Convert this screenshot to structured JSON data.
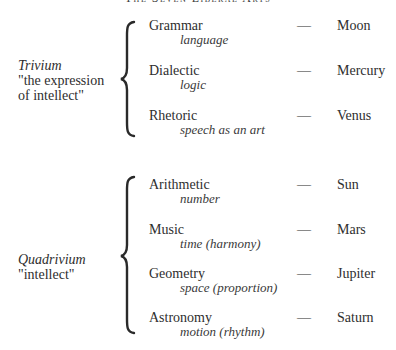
{
  "title": "The Seven Liberal Arts",
  "groups": [
    {
      "name": "Trivium",
      "description_lines": [
        "\"the expression",
        "of intellect\""
      ],
      "items": [
        {
          "art": "Grammar",
          "quality": "language",
          "dash": "—",
          "planet": "Moon"
        },
        {
          "art": "Dialectic",
          "quality": "logic",
          "dash": "—",
          "planet": "Mercury"
        },
        {
          "art": "Rhetoric",
          "quality": "speech as an art",
          "dash": "—",
          "planet": "Venus"
        }
      ]
    },
    {
      "name": "Quadrivium",
      "description_lines": [
        "\"intellect\""
      ],
      "items": [
        {
          "art": "Arithmetic",
          "quality": "number",
          "dash": "—",
          "planet": "Sun"
        },
        {
          "art": "Music",
          "quality": "time (harmony)",
          "dash": "—",
          "planet": "Mars"
        },
        {
          "art": "Geometry",
          "quality": "space (proportion)",
          "dash": "—",
          "planet": "Jupiter"
        },
        {
          "art": "Astronomy",
          "quality": "motion (rhythm)",
          "dash": "—",
          "planet": "Saturn"
        }
      ]
    }
  ],
  "colors": {
    "text": "#2e2e2e",
    "brace": "#2a2a2a",
    "background": "#ffffff"
  }
}
